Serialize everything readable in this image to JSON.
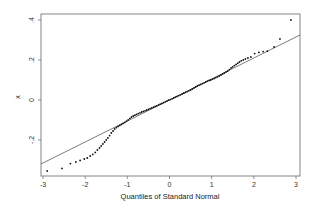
{
  "chart_data": {
    "type": "scatter",
    "title": "",
    "xlabel": "Quantiles of Standard Normal",
    "ylabel": "x",
    "xlim": [
      -3,
      3
    ],
    "ylim": [
      -0.38,
      0.42
    ],
    "x_ticks": [
      "-3",
      "-2",
      "-1",
      "0",
      "1",
      "2",
      "3"
    ],
    "y_ticks": [
      "-.2",
      "0",
      ".2",
      ".4"
    ],
    "grid": false,
    "legend": null,
    "reference_line": {
      "slope": 0.105,
      "intercept": 0.0,
      "description": "Q-Q reference line"
    },
    "series": [
      {
        "name": "sample quantiles",
        "points": [
          [
            -2.9,
            -0.355
          ],
          [
            -2.55,
            -0.342
          ],
          [
            -2.35,
            -0.318
          ],
          [
            -2.22,
            -0.31
          ],
          [
            -2.12,
            -0.302
          ],
          [
            -2.02,
            -0.295
          ],
          [
            -1.95,
            -0.29
          ],
          [
            -1.88,
            -0.28
          ],
          [
            -1.82,
            -0.272
          ],
          [
            -1.76,
            -0.262
          ],
          [
            -1.71,
            -0.25
          ],
          [
            -1.66,
            -0.24
          ],
          [
            -1.62,
            -0.23
          ],
          [
            -1.58,
            -0.22
          ],
          [
            -1.54,
            -0.21
          ],
          [
            -1.5,
            -0.2
          ],
          [
            -1.46,
            -0.19
          ],
          [
            -1.42,
            -0.178
          ],
          [
            -1.38,
            -0.165
          ],
          [
            -1.34,
            -0.155
          ],
          [
            -1.3,
            -0.145
          ],
          [
            -1.26,
            -0.138
          ],
          [
            -1.22,
            -0.132
          ],
          [
            -1.18,
            -0.127
          ],
          [
            -1.14,
            -0.122
          ],
          [
            -1.1,
            -0.117
          ],
          [
            -1.06,
            -0.112
          ],
          [
            -1.02,
            -0.106
          ],
          [
            -0.98,
            -0.1
          ],
          [
            -0.94,
            -0.092
          ],
          [
            -0.9,
            -0.085
          ],
          [
            -0.86,
            -0.08
          ],
          [
            -0.82,
            -0.076
          ],
          [
            -0.78,
            -0.072
          ],
          [
            -0.74,
            -0.068
          ],
          [
            -0.7,
            -0.064
          ],
          [
            -0.66,
            -0.06
          ],
          [
            -0.62,
            -0.057
          ],
          [
            -0.58,
            -0.054
          ],
          [
            -0.54,
            -0.05
          ],
          [
            -0.5,
            -0.047
          ],
          [
            -0.46,
            -0.043
          ],
          [
            -0.42,
            -0.04
          ],
          [
            -0.38,
            -0.036
          ],
          [
            -0.34,
            -0.032
          ],
          [
            -0.3,
            -0.029
          ],
          [
            -0.26,
            -0.025
          ],
          [
            -0.22,
            -0.021
          ],
          [
            -0.18,
            -0.017
          ],
          [
            -0.14,
            -0.013
          ],
          [
            -0.1,
            -0.009
          ],
          [
            -0.06,
            -0.005
          ],
          [
            -0.02,
            -0.001
          ],
          [
            0.02,
            0.002
          ],
          [
            0.06,
            0.006
          ],
          [
            0.1,
            0.01
          ],
          [
            0.14,
            0.014
          ],
          [
            0.18,
            0.018
          ],
          [
            0.22,
            0.022
          ],
          [
            0.26,
            0.026
          ],
          [
            0.3,
            0.03
          ],
          [
            0.34,
            0.034
          ],
          [
            0.38,
            0.038
          ],
          [
            0.42,
            0.042
          ],
          [
            0.46,
            0.046
          ],
          [
            0.5,
            0.05
          ],
          [
            0.54,
            0.055
          ],
          [
            0.58,
            0.06
          ],
          [
            0.62,
            0.065
          ],
          [
            0.66,
            0.07
          ],
          [
            0.7,
            0.074
          ],
          [
            0.74,
            0.078
          ],
          [
            0.78,
            0.082
          ],
          [
            0.82,
            0.086
          ],
          [
            0.86,
            0.09
          ],
          [
            0.9,
            0.094
          ],
          [
            0.94,
            0.098
          ],
          [
            0.98,
            0.1
          ],
          [
            1.02,
            0.104
          ],
          [
            1.06,
            0.108
          ],
          [
            1.1,
            0.112
          ],
          [
            1.14,
            0.116
          ],
          [
            1.18,
            0.12
          ],
          [
            1.22,
            0.125
          ],
          [
            1.26,
            0.13
          ],
          [
            1.3,
            0.135
          ],
          [
            1.34,
            0.14
          ],
          [
            1.38,
            0.145
          ],
          [
            1.42,
            0.152
          ],
          [
            1.46,
            0.16
          ],
          [
            1.5,
            0.166
          ],
          [
            1.54,
            0.172
          ],
          [
            1.58,
            0.178
          ],
          [
            1.62,
            0.184
          ],
          [
            1.66,
            0.19
          ],
          [
            1.7,
            0.196
          ],
          [
            1.75,
            0.2
          ],
          [
            1.8,
            0.205
          ],
          [
            1.86,
            0.21
          ],
          [
            1.93,
            0.215
          ],
          [
            2.02,
            0.232
          ],
          [
            2.12,
            0.238
          ],
          [
            2.22,
            0.242
          ],
          [
            2.32,
            0.244
          ],
          [
            2.48,
            0.265
          ],
          [
            2.62,
            0.305
          ],
          [
            2.88,
            0.4
          ]
        ]
      }
    ]
  }
}
